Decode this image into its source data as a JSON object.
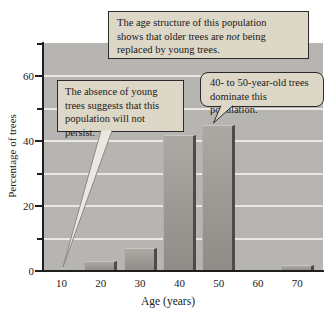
{
  "chart_data": {
    "type": "bar",
    "title": "",
    "xlabel": "Age (years)",
    "ylabel": "Percentage of trees",
    "categories": [
      "10",
      "20",
      "30",
      "40",
      "50",
      "60",
      "70"
    ],
    "values": [
      0,
      3,
      7,
      42,
      45,
      0,
      2
    ],
    "ylim": [
      0,
      70
    ],
    "yticks_major": [
      0,
      20,
      40,
      60
    ],
    "yticks_minor": [
      10,
      30,
      50,
      70
    ],
    "grid": "horizontal",
    "legend": "none",
    "plot_bg": "#b7b5b2",
    "gridline_color": "#e9e8e5",
    "bar_face_top": "#aca8a4",
    "bar_face_bottom": "#8f8b87",
    "bar_edge": "#4d4a47"
  },
  "callouts": {
    "box_bg": "#ddd7c7",
    "pointer_fill": "#eae8e0",
    "age_structure": {
      "line1": "The age structure of this population",
      "line2_pre": "shows that older trees are ",
      "line2_em": "not",
      "line2_post": " being",
      "line3": "replaced by young trees."
    },
    "dominant": {
      "line1": "40- to 50-year-old trees",
      "line2": "dominate this population."
    },
    "absence": {
      "line1": "The absence of young",
      "line2": "trees suggests that this",
      "line3": "population will not persist."
    }
  }
}
